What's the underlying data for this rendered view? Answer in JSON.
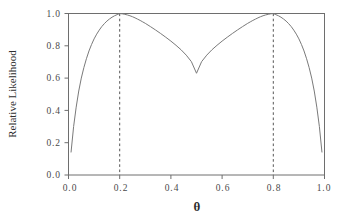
{
  "figure": {
    "background_color": "#ffffff",
    "line_color": "#7a7a7a",
    "axis_color": "#6e6e6e",
    "reference_line_color": "#555555",
    "text_color": "#2e2e2e"
  },
  "chart_data": {
    "type": "line",
    "title": "",
    "subtitle": "",
    "xlabel": "θ",
    "ylabel": "Relative Likelihood",
    "xlim": [
      0.0,
      1.0
    ],
    "ylim": [
      0.0,
      1.0
    ],
    "grid": false,
    "legend": null,
    "legend_position": "none",
    "x_ticks": [
      0.0,
      0.2,
      0.4,
      0.6,
      0.8,
      1.0
    ],
    "x_tick_labels": [
      "0.0",
      "0.2",
      "0.4",
      "0.6",
      "0.8",
      "1.0"
    ],
    "y_ticks": [
      0.0,
      0.2,
      0.4,
      0.6,
      0.8,
      1.0
    ],
    "y_tick_labels": [
      "0.0",
      "0.2",
      "0.4",
      "0.6",
      "0.8",
      "1.0"
    ],
    "annotations": [
      {
        "type": "vline",
        "x": 0.2,
        "style": "dashed",
        "label": ""
      },
      {
        "type": "vline",
        "x": 0.8,
        "style": "dashed",
        "label": ""
      }
    ],
    "series": [
      {
        "name": "Relative Likelihood",
        "style": "solid",
        "x": [
          0.01,
          0.02,
          0.03,
          0.04,
          0.05,
          0.06,
          0.07,
          0.08,
          0.09,
          0.1,
          0.11,
          0.12,
          0.13,
          0.14,
          0.15,
          0.16,
          0.17,
          0.18,
          0.19,
          0.2,
          0.21,
          0.22,
          0.23,
          0.24,
          0.25,
          0.26,
          0.27,
          0.28,
          0.29,
          0.3,
          0.32,
          0.34,
          0.36,
          0.38,
          0.4,
          0.42,
          0.44,
          0.46,
          0.48,
          0.5,
          0.52,
          0.54,
          0.56,
          0.58,
          0.6,
          0.62,
          0.64,
          0.66,
          0.68,
          0.7,
          0.71,
          0.72,
          0.73,
          0.74,
          0.75,
          0.76,
          0.77,
          0.78,
          0.79,
          0.8,
          0.81,
          0.82,
          0.83,
          0.84,
          0.85,
          0.86,
          0.87,
          0.88,
          0.89,
          0.9,
          0.91,
          0.92,
          0.93,
          0.94,
          0.95,
          0.96,
          0.97,
          0.98,
          0.99
        ],
        "y": [
          0.142,
          0.3,
          0.42,
          0.52,
          0.6,
          0.665,
          0.72,
          0.768,
          0.808,
          0.843,
          0.872,
          0.897,
          0.919,
          0.937,
          0.953,
          0.966,
          0.977,
          0.986,
          0.993,
          1.0,
          0.998,
          0.995,
          0.991,
          0.986,
          0.98,
          0.973,
          0.965,
          0.957,
          0.948,
          0.939,
          0.919,
          0.898,
          0.876,
          0.853,
          0.829,
          0.803,
          0.775,
          0.742,
          0.702,
          0.63,
          0.702,
          0.742,
          0.775,
          0.803,
          0.829,
          0.853,
          0.876,
          0.898,
          0.919,
          0.939,
          0.948,
          0.957,
          0.965,
          0.973,
          0.98,
          0.986,
          0.991,
          0.995,
          0.998,
          1.0,
          0.993,
          0.986,
          0.977,
          0.966,
          0.953,
          0.937,
          0.919,
          0.897,
          0.872,
          0.843,
          0.808,
          0.768,
          0.72,
          0.665,
          0.6,
          0.52,
          0.42,
          0.3,
          0.142
        ]
      }
    ],
    "peaks": [
      {
        "x": 0.2,
        "y": 1.0
      },
      {
        "x": 0.8,
        "y": 1.0
      }
    ],
    "local_minimum": {
      "x": 0.5,
      "y": 0.63
    }
  }
}
